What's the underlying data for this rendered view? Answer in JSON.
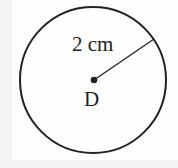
{
  "diagram": {
    "radius_label": "2 cm",
    "center_label": "D",
    "colors": {
      "stroke": "#222222",
      "background": "#fefefe"
    }
  }
}
